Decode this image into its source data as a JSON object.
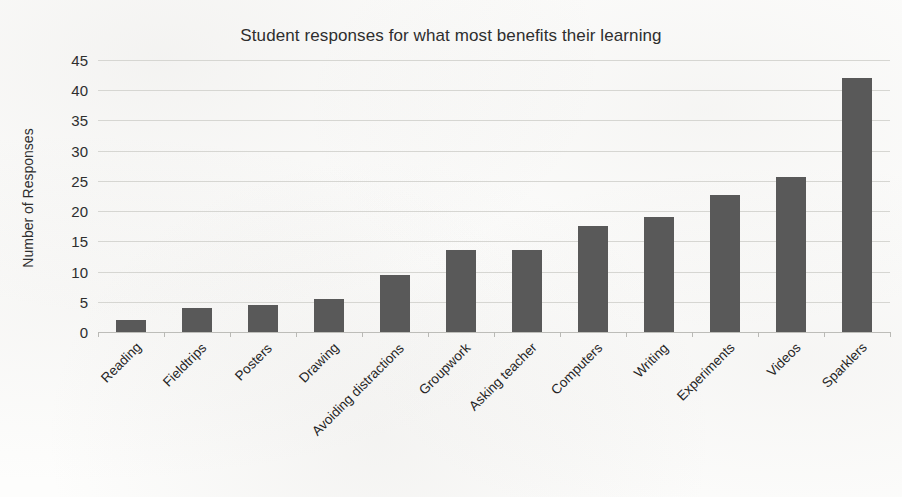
{
  "chart_data": {
    "type": "bar",
    "title": "Student responses for what most benefits their learning",
    "xlabel": "",
    "ylabel": "Number of Responses",
    "categories": [
      "Reading",
      "Fieldtrips",
      "Posters",
      "Drawing",
      "Avoiding distractions",
      "Groupwork",
      "Asking teacher",
      "Computers",
      "Writing",
      "Experiments",
      "Videos",
      "Sparklers"
    ],
    "values": [
      2,
      4,
      4.4,
      5.5,
      9.5,
      13.5,
      13.6,
      17.6,
      19,
      22.7,
      25.7,
      42
    ],
    "ylim": [
      0,
      45
    ],
    "yticks": [
      0,
      5,
      10,
      15,
      20,
      25,
      30,
      35,
      40,
      45
    ],
    "ytick_labels": [
      "0",
      "5",
      "10",
      "15",
      "20",
      "25",
      "30",
      "35",
      "40",
      "45"
    ],
    "grid": true,
    "legend": false,
    "bar_color": "#595959",
    "gridline_color": "#d6d6d2",
    "text_color": "#2e2e2e",
    "background_color": "#fdfdfc"
  }
}
